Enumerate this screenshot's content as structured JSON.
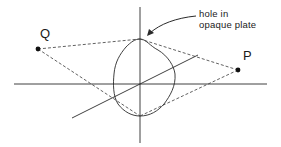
{
  "diagram": {
    "labels": {
      "point_q": "Q",
      "point_p": "P",
      "annotation_line1": "hole in",
      "annotation_line2": "opaque plate"
    },
    "colors": {
      "stroke": "#2a2a2a",
      "dashed": "#3a3a3a",
      "background": "#ffffff"
    },
    "elements": [
      {
        "type": "axis",
        "name": "vertical-axis"
      },
      {
        "type": "axis",
        "name": "horizontal-axis"
      },
      {
        "type": "axis",
        "name": "diagonal-axis"
      },
      {
        "type": "shape",
        "name": "hole-outline"
      },
      {
        "type": "point",
        "name": "Q"
      },
      {
        "type": "point",
        "name": "P"
      },
      {
        "type": "dashed-lines",
        "name": "rays from Q and P to hole top and bottom"
      },
      {
        "type": "arrow",
        "name": "annotation-arrow"
      }
    ]
  }
}
